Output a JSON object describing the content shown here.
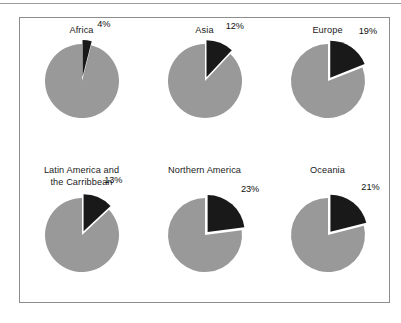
{
  "figure": {
    "background": "#ffffff",
    "frame_color": "#8d8d8d",
    "rule_color": "#9a9a9a"
  },
  "chart_data": {
    "type": "pie",
    "title": "",
    "subtitle": "",
    "xlabel": "",
    "ylabel": "",
    "grid": false,
    "legend_position": "none",
    "layout": {
      "rows": 2,
      "columns": 3
    },
    "slice_colors": {
      "highlight": "#191919",
      "remainder": "#999999",
      "gap": "#ffffff"
    },
    "slice_labels": [
      "highlighted share",
      "remainder"
    ],
    "units": "percent",
    "panels": [
      {
        "title": "Africa",
        "title_lines": [
          "Africa"
        ],
        "categories": [
          "highlighted share",
          "remainder"
        ],
        "values": [
          4,
          96
        ],
        "label": "4%",
        "value": 4
      },
      {
        "title": "Asia",
        "title_lines": [
          "Asia"
        ],
        "categories": [
          "highlighted share",
          "remainder"
        ],
        "values": [
          12,
          88
        ],
        "label": "12%",
        "value": 12
      },
      {
        "title": "Europe",
        "title_lines": [
          "Europe"
        ],
        "categories": [
          "highlighted share",
          "remainder"
        ],
        "values": [
          19,
          81
        ],
        "label": "19%",
        "value": 19
      },
      {
        "title": "Latin America and the Carribbean",
        "title_lines": [
          "Latin America and",
          "the Carribbean"
        ],
        "categories": [
          "highlighted share",
          "remainder"
        ],
        "values": [
          13,
          87
        ],
        "label": "13%",
        "value": 13
      },
      {
        "title": "Northern America",
        "title_lines": [
          "Northern America"
        ],
        "categories": [
          "highlighted share",
          "remainder"
        ],
        "values": [
          23,
          77
        ],
        "label": "23%",
        "value": 23
      },
      {
        "title": "Oceania",
        "title_lines": [
          "Oceania"
        ],
        "categories": [
          "highlighted share",
          "remainder"
        ],
        "values": [
          21,
          79
        ],
        "label": "21%",
        "value": 21
      }
    ]
  }
}
